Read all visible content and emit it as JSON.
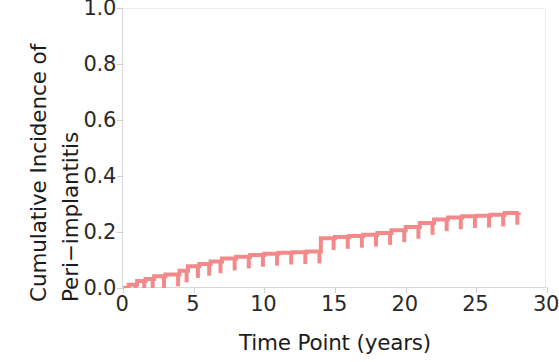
{
  "chart_data": {
    "type": "line",
    "subtype": "kaplan-meier-cumulative-incidence-step",
    "title": "",
    "xlabel": "Time Point (years)",
    "ylabel": "Cumulative Incidence of Peri−implantitis",
    "ylabel_lines": [
      "Cumulative Incidence of",
      "Peri−implantitis"
    ],
    "xlim": [
      0,
      30
    ],
    "ylim": [
      0.0,
      1.0
    ],
    "xticks": [
      0,
      5,
      10,
      15,
      20,
      25,
      30
    ],
    "xticklabels": [
      "0",
      "5",
      "10",
      "15",
      "20",
      "25",
      "30"
    ],
    "yticks": [
      0.0,
      0.2,
      0.4,
      0.6,
      0.8,
      1.0
    ],
    "yticklabels": [
      "0.0",
      "0.2",
      "0.4",
      "0.6",
      "0.8",
      "1.0"
    ],
    "grid": false,
    "legend": false,
    "line_color": "#F28A8C",
    "line_width": 4,
    "series": [
      {
        "name": "Cumulative incidence of peri-implantitis",
        "step": "post",
        "x": [
          0.0,
          0.4,
          1.0,
          1.6,
          2.2,
          3.0,
          4.0,
          4.6,
          5.4,
          6.2,
          7.0,
          8.0,
          9.0,
          10.0,
          11.0,
          12.0,
          13.0,
          14.0,
          15.0,
          16.0,
          17.0,
          18.0,
          19.0,
          20.0,
          21.0,
          22.0,
          23.0,
          24.0,
          25.0,
          26.0,
          27.0,
          28.0
        ],
        "y": [
          0.0,
          0.012,
          0.025,
          0.032,
          0.042,
          0.048,
          0.062,
          0.078,
          0.086,
          0.095,
          0.105,
          0.112,
          0.118,
          0.122,
          0.126,
          0.128,
          0.13,
          0.178,
          0.182,
          0.186,
          0.19,
          0.196,
          0.206,
          0.218,
          0.232,
          0.245,
          0.252,
          0.256,
          0.258,
          0.262,
          0.268,
          0.27
        ]
      }
    ],
    "censor_marks": {
      "description": "downward vertical tick marks on the step curve indicating censored observations",
      "length_fraction_of_axis": 0.042,
      "x": [
        0.9,
        1.5,
        2.1,
        2.9,
        3.9,
        4.5,
        5.3,
        6.1,
        6.9,
        7.9,
        8.9,
        9.9,
        10.9,
        11.9,
        12.9,
        13.9,
        14.9,
        15.9,
        16.9,
        17.9,
        18.9,
        19.9,
        20.9,
        21.9,
        22.9,
        23.9,
        24.9,
        25.9,
        26.9,
        27.9
      ],
      "y": [
        0.012,
        0.025,
        0.032,
        0.042,
        0.048,
        0.062,
        0.078,
        0.086,
        0.095,
        0.105,
        0.112,
        0.118,
        0.122,
        0.126,
        0.128,
        0.13,
        0.178,
        0.182,
        0.186,
        0.19,
        0.196,
        0.206,
        0.218,
        0.232,
        0.245,
        0.252,
        0.256,
        0.258,
        0.262,
        0.268
      ]
    }
  },
  "axes": {
    "x_title": "Time Point (years)",
    "y_title_line1": "Cumulative Incidence of",
    "y_title_line2": "Peri−implantitis"
  },
  "colors": {
    "curve": "#F28A8C",
    "spine": "#d8d8dc",
    "spine_light": "#eeeef1",
    "text": "#1c1c1c",
    "tick_text": "#2a2a2a",
    "background": "#ffffff"
  }
}
